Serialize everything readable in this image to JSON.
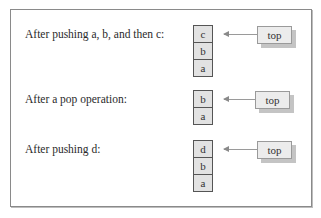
{
  "diagram": {
    "rows": [
      {
        "caption": "After pushing a, b, and then c:",
        "stack": [
          "c",
          "b",
          "a"
        ],
        "pointer_label": "top"
      },
      {
        "caption": "After a pop operation:",
        "stack": [
          "b",
          "a"
        ],
        "pointer_label": "top"
      },
      {
        "caption": "After pushing d:",
        "stack": [
          "d",
          "b",
          "a"
        ],
        "pointer_label": "top"
      }
    ],
    "colors": {
      "cell_fill": "#e2e2e2",
      "cell_border": "#555555",
      "top_box_fill": "#ececec",
      "shadow": "#c4c4c4",
      "frame_border": "#8a8a8a"
    }
  }
}
